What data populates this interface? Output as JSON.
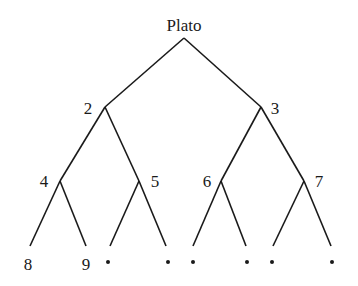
{
  "tree": {
    "root": {
      "label": "Plato"
    },
    "nodes": [
      {
        "id": "n2",
        "label": "2"
      },
      {
        "id": "n3",
        "label": "3"
      },
      {
        "id": "n4",
        "label": "4"
      },
      {
        "id": "n5",
        "label": "5"
      },
      {
        "id": "n6",
        "label": "6"
      },
      {
        "id": "n7",
        "label": "7"
      },
      {
        "id": "n8",
        "label": "8"
      },
      {
        "id": "n9",
        "label": "9"
      }
    ],
    "unlabeled_leaves": 6
  }
}
